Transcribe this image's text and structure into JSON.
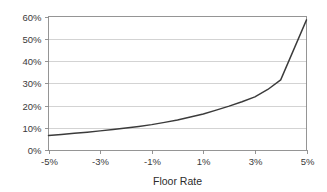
{
  "chart_data": {
    "type": "line",
    "title": "",
    "subtitle": "",
    "xlabel": "Floor Rate",
    "ylabel": "",
    "xlim": [
      -5,
      5
    ],
    "ylim": [
      0,
      60
    ],
    "grid": true,
    "grid_axis": "y",
    "legend": false,
    "legend_position": "none",
    "x_tick_labels": [
      "-5%",
      "-3%",
      "-1%",
      "1%",
      "3%",
      "5%"
    ],
    "x_tick_values": [
      -5,
      -3,
      -1,
      1,
      3,
      5
    ],
    "y_tick_labels": [
      "0%",
      "10%",
      "20%",
      "30%",
      "40%",
      "50%",
      "60%"
    ],
    "y_tick_values": [
      0,
      10,
      20,
      30,
      40,
      50,
      60
    ],
    "series": [
      {
        "name": "value",
        "color": "#3b3b3b",
        "x": [
          -5.0,
          -4.5,
          -4.0,
          -3.5,
          -3.0,
          -2.5,
          -2.0,
          -1.5,
          -1.0,
          -0.5,
          0.0,
          0.5,
          1.0,
          1.5,
          2.0,
          2.5,
          3.0,
          3.5,
          4.0,
          4.5,
          5.0
        ],
        "values": [
          6.5,
          7.0,
          7.5,
          8.0,
          8.6,
          9.2,
          9.9,
          10.6,
          11.4,
          12.4,
          13.5,
          14.8,
          16.2,
          17.9,
          19.7,
          21.7,
          23.9,
          27.2,
          31.5,
          45.0,
          58.5
        ]
      }
    ],
    "annotations": [
      {
        "label": "kink",
        "x": 4.0,
        "y": 31.5
      }
    ],
    "colors": {
      "line": "#3b3b3b",
      "grid": "#c8c8c8",
      "axis": "#8a8a8a",
      "text": "#3a3a3a",
      "background": "#ffffff"
    }
  },
  "axis_titles": {
    "x": "Floor Rate"
  }
}
